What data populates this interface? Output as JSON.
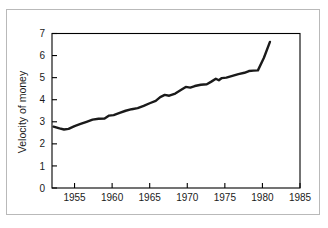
{
  "figure": {
    "background_color": "#ffffff",
    "frame_color": "#b9b9b9",
    "axis_color": "#000000",
    "line_color": "#1a1a1a"
  },
  "chart_data": {
    "type": "line",
    "title": "",
    "subtitle": "",
    "xlabel": "",
    "ylabel": "Velocity of money",
    "xlim": [
      1952,
      1985
    ],
    "ylim": [
      0,
      7
    ],
    "grid": false,
    "legend": null,
    "annotations": [],
    "x_ticks": [
      1955,
      1960,
      1965,
      1970,
      1975,
      1980,
      1985
    ],
    "x_tick_labels": [
      "1955",
      "1960",
      "1965",
      "1970",
      "1975",
      "1980",
      "1985"
    ],
    "y_ticks": [
      0,
      1,
      2,
      3,
      4,
      5,
      6,
      7
    ],
    "y_tick_labels": [
      "0",
      "1",
      "2",
      "3",
      "4",
      "5",
      "6",
      "7"
    ],
    "series": [
      {
        "name": "Velocity of money",
        "x": [
          1952.2,
          1953.0,
          1953.6,
          1954.2,
          1955.0,
          1955.8,
          1956.6,
          1957.4,
          1958.2,
          1959.0,
          1959.6,
          1960.2,
          1961.0,
          1961.8,
          1962.6,
          1963.4,
          1964.2,
          1965.0,
          1965.8,
          1966.4,
          1967.0,
          1967.6,
          1968.4,
          1969.2,
          1969.8,
          1970.4,
          1971.0,
          1971.8,
          1972.6,
          1973.2,
          1973.8,
          1974.2,
          1974.6,
          1975.2,
          1976.0,
          1976.8,
          1977.6,
          1978.2,
          1978.8,
          1979.4,
          1980.2,
          1981.0
        ],
        "y": [
          2.78,
          2.7,
          2.65,
          2.68,
          2.8,
          2.9,
          3.0,
          3.1,
          3.14,
          3.15,
          3.28,
          3.3,
          3.4,
          3.5,
          3.57,
          3.62,
          3.72,
          3.84,
          3.95,
          4.12,
          4.22,
          4.18,
          4.28,
          4.45,
          4.58,
          4.55,
          4.62,
          4.68,
          4.7,
          4.82,
          4.95,
          4.88,
          4.98,
          5.0,
          5.08,
          5.16,
          5.22,
          5.3,
          5.32,
          5.33,
          5.9,
          6.62
        ]
      }
    ]
  }
}
